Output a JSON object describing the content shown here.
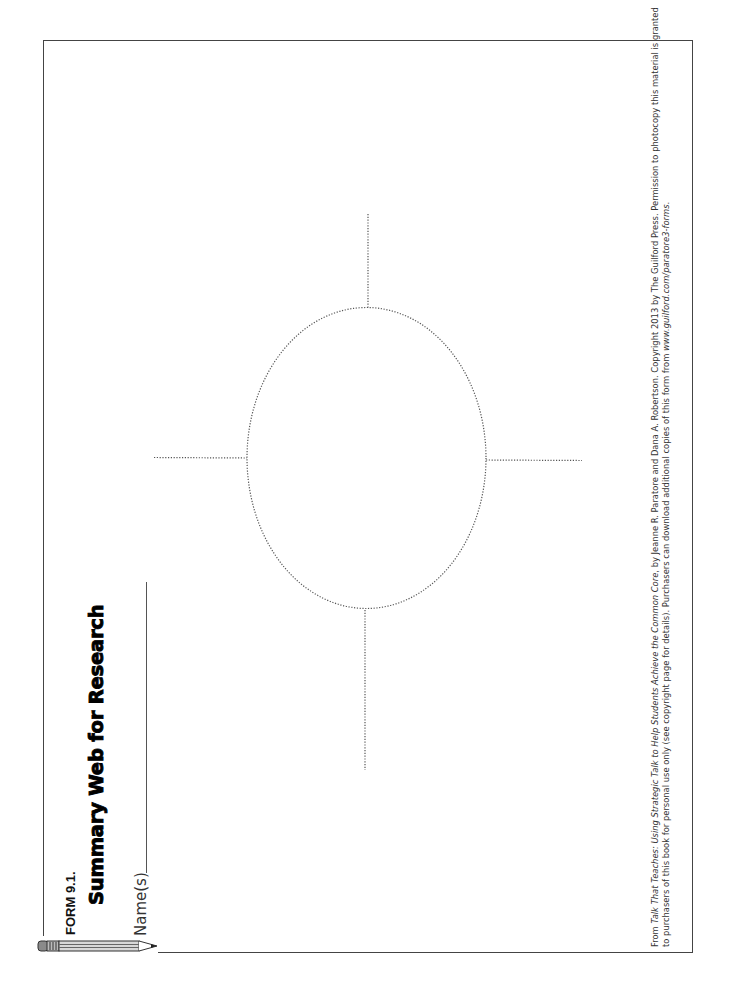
{
  "form": {
    "label": "FORM 9.1.",
    "title": "Summary Web for Research",
    "name_field_label": "Name(s)",
    "name_field_value": ""
  },
  "diagram": {
    "type": "summary-web",
    "center_shape": "dotted ellipse",
    "spokes": [
      "top",
      "right",
      "bottom",
      "left"
    ],
    "stroke_style": "dotted"
  },
  "footer": {
    "line1_prefix": "From ",
    "book_title": "Talk That Teaches: Using Strategic Talk to Help Students Achieve the Common Core",
    "line1_suffix": ", by Jeanne R. Paratore and Dana A. Robertson. Copyright 2013 by The Guilford Press. Permission to photocopy this material is granted",
    "line2_prefix": "to purchasers of this book for personal use only (see copyright page for details). Purchasers can download additional copies of this form from ",
    "url": "www.guilford.com/paratore3-forms",
    "line2_suffix": "."
  },
  "icons": {
    "pencil": "pencil-icon"
  },
  "colors": {
    "border": "#444444",
    "text": "#1a1a1a",
    "dotted": "#555555"
  }
}
